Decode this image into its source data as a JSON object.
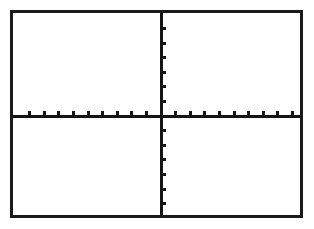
{
  "screen": {
    "device": "graphing-calculator-display",
    "background_color": "#ffffff",
    "ink_color": "#141414",
    "frame_color": "#1a1a1a"
  },
  "frame": {
    "x": 10,
    "y": 10,
    "width": 293,
    "height": 208,
    "border_width": 3
  },
  "chart_data": {
    "type": "scatter",
    "title": "",
    "subtitle": "",
    "xlabel": "",
    "ylabel": "",
    "series": [
      {
        "name": "",
        "x": [],
        "y": []
      }
    ],
    "xlim": [
      -10,
      10
    ],
    "ylim": [
      -7,
      7
    ],
    "xtick_step": 1,
    "ytick_step": 1,
    "xticks": [
      -9,
      -8,
      -7,
      -6,
      -5,
      -4,
      -3,
      -2,
      -1,
      1,
      2,
      3,
      4,
      5,
      6,
      7,
      8,
      9
    ],
    "yticks": [
      -6,
      -5,
      -4,
      -3,
      -2,
      -1,
      1,
      2,
      3,
      4,
      5,
      6
    ],
    "xtick_labels": [],
    "ytick_labels": [],
    "grid": false,
    "legend": false,
    "legend_position": "none",
    "annotations": [],
    "axis_origin_px": {
      "x": 148,
      "y": 103
    },
    "x_axis_tick_direction": "up",
    "y_axis_tick_direction": "right",
    "tick_length_px": 5,
    "x_tick_spacing_px": 14.6,
    "y_tick_spacing_px": 14.6,
    "note": "Empty coordinate plane: axes and tick marks only, no plotted data"
  },
  "axes": {
    "x_axis": {
      "name": "x-axis",
      "orientation": "horizontal",
      "position_px": 103,
      "tick_count": 18
    },
    "y_axis": {
      "name": "y-axis",
      "orientation": "vertical",
      "position_px": 148,
      "tick_count": 12
    }
  }
}
